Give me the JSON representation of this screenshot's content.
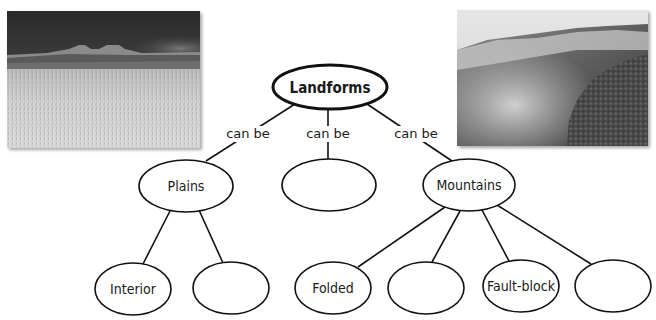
{
  "diagram": {
    "title": "Landforms",
    "root": {
      "id": "landforms",
      "label": "Landforms",
      "cx": 330,
      "cy": 87,
      "rx": 57,
      "ry": 22
    },
    "level1": [
      {
        "id": "plains",
        "label": "Plains",
        "cx": 186,
        "cy": 186,
        "rx": 47,
        "ry": 26,
        "edge_label": "can be"
      },
      {
        "id": "blank-middle",
        "label": "",
        "cx": 329,
        "cy": 185,
        "rx": 47,
        "ry": 26,
        "edge_label": "can be"
      },
      {
        "id": "mountains",
        "label": "Mountains",
        "cx": 469,
        "cy": 185,
        "rx": 46,
        "ry": 26,
        "edge_label": "can be"
      }
    ],
    "level2": [
      {
        "id": "interior",
        "parent": "plains",
        "label": "Interior",
        "cx": 133,
        "cy": 289,
        "rx": 38,
        "ry": 26
      },
      {
        "id": "blank-plains-2",
        "parent": "plains",
        "label": "",
        "cx": 231,
        "cy": 288,
        "rx": 38,
        "ry": 26
      },
      {
        "id": "folded",
        "parent": "mountains",
        "label": "Folded",
        "cx": 333,
        "cy": 288,
        "rx": 38,
        "ry": 26
      },
      {
        "id": "blank-mountains-2",
        "parent": "mountains",
        "label": "",
        "cx": 426,
        "cy": 288,
        "rx": 38,
        "ry": 26
      },
      {
        "id": "fault-block",
        "parent": "mountains",
        "label": "Fault-block",
        "cx": 521,
        "cy": 286,
        "rx": 38,
        "ry": 26
      },
      {
        "id": "blank-mountains-4",
        "parent": "mountains",
        "label": "",
        "cx": 613,
        "cy": 286,
        "rx": 38,
        "ry": 26
      }
    ],
    "edge_labels": [
      "can be",
      "can be",
      "can be"
    ]
  },
  "photos": [
    {
      "id": "plains-photo",
      "subject": "grassy plain with distant mesas under dark sky"
    },
    {
      "id": "mountains-photo",
      "subject": "forested mountain slope with mist"
    }
  ],
  "colors": {
    "stroke": "#111111",
    "fill": "#ffffff",
    "text": "#1a1a1a"
  }
}
